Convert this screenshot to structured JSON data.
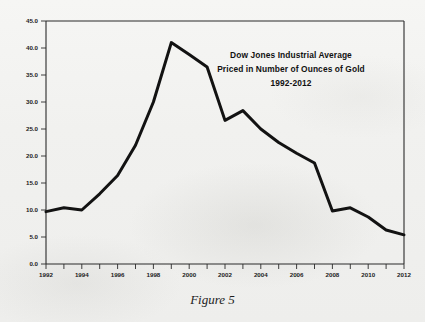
{
  "figure": {
    "caption": "Figure 5"
  },
  "chart_data": {
    "type": "line",
    "title": "Dow Jones Industrial Average",
    "title_lines": [
      "Dow Jones Industrial Average",
      "Priced in Number of Ounces of Gold",
      "1992-2012"
    ],
    "subtitle": "Priced in Number of Ounces of Gold",
    "period": "1992-2012",
    "xlabel": "",
    "ylabel": "",
    "grid": false,
    "legend": "none",
    "xlim": [
      1992,
      2012
    ],
    "ylim": [
      0.0,
      45.0
    ],
    "x": [
      1992,
      1993,
      1994,
      1995,
      1996,
      1997,
      1998,
      1999,
      2000,
      2001,
      2002,
      2003,
      2004,
      2005,
      2006,
      2007,
      2008,
      2009,
      2010,
      2011,
      2012
    ],
    "values": [
      9.7,
      10.4,
      10.0,
      13.0,
      16.4,
      22.0,
      30.0,
      41.0,
      38.8,
      36.5,
      26.6,
      28.4,
      25.0,
      22.5,
      20.5,
      18.7,
      9.8,
      10.4,
      8.7,
      6.3,
      5.4
    ],
    "series": [
      {
        "name": "Dow Jones Industrial Average in ounces of gold",
        "color": "#121212",
        "values": [
          9.7,
          10.4,
          10.0,
          13.0,
          16.4,
          22.0,
          30.0,
          41.0,
          38.8,
          36.5,
          26.6,
          28.4,
          25.0,
          22.5,
          20.5,
          18.7,
          9.8,
          10.4,
          8.7,
          6.3,
          5.4
        ]
      }
    ],
    "y_ticks": [
      0.0,
      5.0,
      10.0,
      15.0,
      20.0,
      25.0,
      30.0,
      35.0,
      40.0,
      45.0
    ],
    "y_tick_labels": [
      "0.0",
      "5.0",
      "10.0",
      "15.0",
      "20.0",
      "25.0",
      "30.0",
      "35.0",
      "40.0",
      "45.0"
    ],
    "x_ticks": [
      1992,
      1993,
      1994,
      1995,
      1996,
      1997,
      1998,
      1999,
      2000,
      2001,
      2002,
      2003,
      2004,
      2005,
      2006,
      2007,
      2008,
      2009,
      2010,
      2011,
      2012
    ],
    "x_tick_labels": [
      "1992",
      "",
      "1994",
      "",
      "1996",
      "",
      "1998",
      "",
      "2000",
      "",
      "2002",
      "",
      "2004",
      "",
      "2006",
      "",
      "2008",
      "",
      "2010",
      "",
      "2012"
    ],
    "x_labeled_ticks": [
      "1992",
      "1994",
      "1996",
      "1998",
      "2000",
      "2002",
      "2004",
      "2006",
      "2008",
      "2010",
      "2012"
    ],
    "line_color": "#121212",
    "axis_color": "#2a2a2a",
    "background_color": "#f1f1ef"
  }
}
